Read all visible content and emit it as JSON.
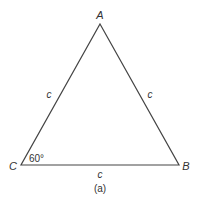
{
  "diagram": {
    "type": "triangle",
    "vertices": {
      "A": {
        "label": "A",
        "x": 100,
        "y": 24
      },
      "B": {
        "label": "B",
        "x": 179,
        "y": 165
      },
      "C": {
        "label": "C",
        "x": 21,
        "y": 165
      }
    },
    "sides": {
      "CA": {
        "label": "c"
      },
      "AB": {
        "label": "c"
      },
      "CB": {
        "label": "c"
      }
    },
    "angle_C": {
      "label": "60°"
    },
    "caption": "(a)",
    "colors": {
      "line": "#444444",
      "text": "#333333",
      "background": "#ffffff"
    }
  }
}
